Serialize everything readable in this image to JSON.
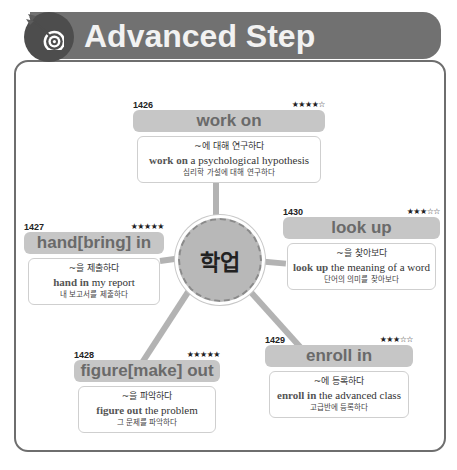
{
  "header": {
    "title": "Advanced Step",
    "icon": "target-icon"
  },
  "hub": {
    "label": "학업"
  },
  "entries": [
    {
      "id": "work-on",
      "number": "1426",
      "stars": "★★★★☆",
      "phrase": "work on",
      "meaning": "~에 대해 연구하다",
      "example_bold": "work on",
      "example_rest": " a psychological hypothesis",
      "translation": "심리학 가설에 대해 연구하다"
    },
    {
      "id": "hand-in",
      "number": "1427",
      "stars": "★★★★★",
      "phrase": "hand[bring] in",
      "meaning": "~을 제출하다",
      "example_bold": "hand in",
      "example_rest": " my report",
      "translation": "내 보고서를 제출하다"
    },
    {
      "id": "look-up",
      "number": "1430",
      "stars": "★★★☆☆",
      "phrase": "look up",
      "meaning": "~을 찾아보다",
      "example_bold": "look up",
      "example_rest": " the meaning of a word",
      "translation": "단어의 의미를 찾아보다"
    },
    {
      "id": "figure-out",
      "number": "1428",
      "stars": "★★★★★",
      "phrase": "figure[make] out",
      "meaning": "~을 파악하다",
      "example_bold": "figure out",
      "example_rest": " the problem",
      "translation": "그 문제를 파악하다"
    },
    {
      "id": "enroll-in",
      "number": "1429",
      "stars": "★★★☆☆",
      "phrase": "enroll in",
      "meaning": "~에 등록하다",
      "example_bold": "enroll in",
      "example_rest": " the advanced class",
      "translation": "고급반에 등록하다"
    }
  ],
  "colors": {
    "header_bg": "#717171",
    "logo_bg": "#4d4d4d",
    "phrase_bar": "#c6c6c6",
    "hub": "#b8b8b8",
    "frame_border": "#6e6e6e"
  }
}
